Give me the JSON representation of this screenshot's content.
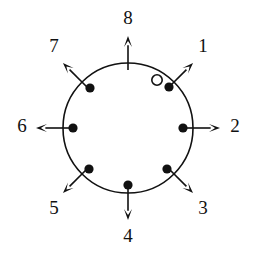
{
  "figure": {
    "title": "",
    "background_color": "#ffffff",
    "stroke_color": "#111111",
    "width": 256,
    "height": 257
  },
  "ring": {
    "center_x": 128,
    "center_y": 128,
    "radius": 65,
    "stroke_color": "#111111",
    "stroke_width": 1.6,
    "fill": "none"
  },
  "directions": [
    {
      "label": "1",
      "angle_deg": 45,
      "label_x": 203,
      "label_y": 48,
      "arrow_from_r": 58,
      "arrow_to_r": 92
    },
    {
      "label": "2",
      "angle_deg": 0,
      "label_x": 235,
      "label_y": 128,
      "arrow_from_r": 58,
      "arrow_to_r": 92
    },
    {
      "label": "3",
      "angle_deg": -45,
      "label_x": 203,
      "label_y": 210,
      "arrow_from_r": 58,
      "arrow_to_r": 92
    },
    {
      "label": "4",
      "angle_deg": -90,
      "label_x": 128,
      "label_y": 238,
      "arrow_from_r": 58,
      "arrow_to_r": 92
    },
    {
      "label": "5",
      "angle_deg": -135,
      "label_x": 54,
      "label_y": 210,
      "arrow_from_r": 58,
      "arrow_to_r": 92
    },
    {
      "label": "6",
      "angle_deg": 180,
      "label_x": 22,
      "label_y": 128,
      "arrow_from_r": 58,
      "arrow_to_r": 92
    },
    {
      "label": "7",
      "angle_deg": 135,
      "label_x": 54,
      "label_y": 48,
      "arrow_from_r": 58,
      "arrow_to_r": 92
    },
    {
      "label": "8",
      "angle_deg": 90,
      "label_x": 128,
      "label_y": 20,
      "arrow_from_r": 58,
      "arrow_to_r": 92
    }
  ],
  "markers": {
    "filled_count": 7,
    "open_count": 1,
    "filled_radius": 4.6,
    "open_radius": 5.2,
    "items": [
      {
        "kind": "open",
        "name": "open-marker-near-1",
        "x": 157,
        "y": 80
      },
      {
        "kind": "filled",
        "name": "filled-marker-1",
        "x": 169,
        "y": 87
      },
      {
        "kind": "filled",
        "name": "filled-marker-2",
        "x": 183,
        "y": 128
      },
      {
        "kind": "filled",
        "name": "filled-marker-3",
        "x": 167,
        "y": 169
      },
      {
        "kind": "filled",
        "name": "filled-marker-4",
        "x": 128,
        "y": 185
      },
      {
        "kind": "filled",
        "name": "filled-marker-5",
        "x": 89,
        "y": 169
      },
      {
        "kind": "filled",
        "name": "filled-marker-6",
        "x": 73,
        "y": 128
      },
      {
        "kind": "filled",
        "name": "filled-marker-7",
        "x": 90,
        "y": 88
      }
    ]
  }
}
